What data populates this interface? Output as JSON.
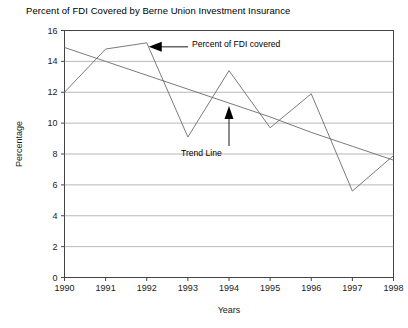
{
  "chart_data": {
    "type": "line",
    "title": "Percent of FDI Covered by Berne Union Investment Insurance",
    "xlabel": "Years",
    "ylabel": "Percentage",
    "grid": true,
    "legend": "none",
    "xlim": [
      1990,
      1998
    ],
    "ylim": [
      0,
      16
    ],
    "ytick_step": 2,
    "x": [
      1990,
      1991,
      1992,
      1993,
      1994,
      1995,
      1996,
      1997,
      1998
    ],
    "xticklabels": [
      "1990",
      "1991",
      "1992",
      "1993",
      "1994",
      "1995",
      "1996",
      "1997",
      "1998"
    ],
    "yticklabels": [
      "0",
      "2",
      "4",
      "6",
      "8",
      "10",
      "12",
      "14",
      "16"
    ],
    "series": [
      {
        "name": "Percent of FDI covered",
        "values": [
          12.0,
          14.8,
          15.2,
          9.1,
          13.4,
          9.7,
          11.9,
          5.6,
          7.9
        ],
        "color": "#6b6b6b"
      },
      {
        "name": "Trend Line",
        "values": [
          14.9,
          14.0,
          13.1,
          12.2,
          11.3,
          10.4,
          9.4,
          8.5,
          7.6
        ],
        "color": "#6b6b6b"
      }
    ],
    "annotations": [
      {
        "label": "Percent of FDI covered",
        "points_to_year": 1992,
        "points_to_value": 15.2
      },
      {
        "label": "Trend Line",
        "points_to_year": 1994,
        "points_to_value": 11.3
      }
    ]
  },
  "colors": {
    "axis": "#444444",
    "grid": "#9a9a9a",
    "line": "#6b6b6b",
    "text": "#000000"
  }
}
